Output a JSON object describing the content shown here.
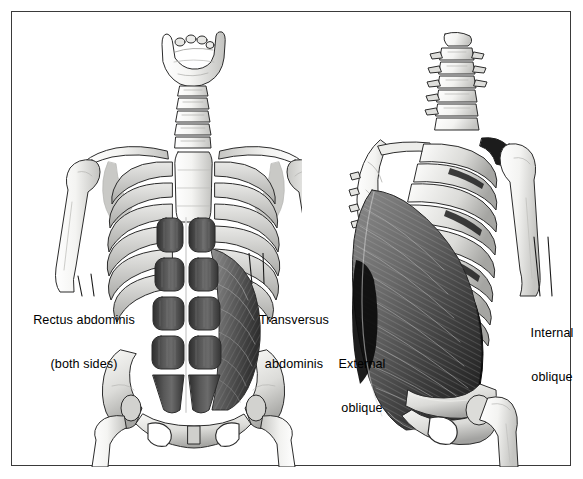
{
  "figure": {
    "style": "grayscale medical line art, two torso skeleton views",
    "border_color": "#3a3a3a",
    "background_color": "#ffffff",
    "text_color": "#000000"
  },
  "labels": {
    "rectus_abdominis": {
      "line1": "Rectus abdominis",
      "line2": "(both sides)",
      "x": 18,
      "y": 283
    },
    "transversus_abdominis": {
      "line1": "Transversus",
      "line2": "abdominis",
      "x": 248,
      "y": 283
    },
    "external_oblique": {
      "line1": "External",
      "line2": "oblique",
      "x": 330,
      "y": 327
    },
    "internal_oblique": {
      "line1": "Internal",
      "line2": "oblique",
      "x": 520,
      "y": 296
    }
  },
  "views": {
    "left": {
      "name": "anterior-view",
      "caption": "Anterior view of torso skeleton with rectus abdominis and transversus abdominis",
      "structures": [
        "mandible",
        "cervical-spine",
        "clavicle",
        "sternum",
        "rib-cage",
        "humerus",
        "pelvis",
        "rectus-abdominis",
        "transversus-abdominis"
      ]
    },
    "right": {
      "name": "posterolateral-oblique-view",
      "caption": "Posterolateral oblique view showing external and internal oblique muscles",
      "structures": [
        "cervical-spine",
        "thoracic-spine",
        "scapula",
        "rib-cage",
        "humerus",
        "pelvis",
        "femur",
        "external-oblique",
        "internal-oblique"
      ]
    }
  },
  "palette": {
    "bone_light": "#fbfbfa",
    "bone_mid": "#d8d8d6",
    "bone_shadow": "#a9a9a7",
    "muscle_dark": "#3c3c3c",
    "muscle_mid": "#6e6e6e",
    "muscle_light": "#9a9a9a",
    "deep_shadow": "#111111",
    "outline": "#2b2b2b"
  }
}
